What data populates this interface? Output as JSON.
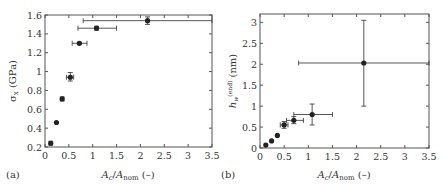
{
  "chart_data": [
    {
      "panel": "(a)",
      "type": "scatter",
      "xlabel": "A_c/A_nom (–)",
      "ylabel": "σ_x (GPa)",
      "xlim": [
        0,
        3.5
      ],
      "ylim": [
        0.2,
        1.6
      ],
      "xticks": [
        0,
        0.5,
        1,
        1.5,
        2,
        2.5,
        3,
        3.5
      ],
      "yticks": [
        0.2,
        0.4,
        0.6,
        0.8,
        1,
        1.2,
        1.4,
        1.6
      ],
      "grid": false,
      "points": [
        {
          "x": 0.12,
          "y": 0.24,
          "xerr": [
            0.1,
            0.14
          ],
          "yerr": [
            0.22,
            0.26
          ]
        },
        {
          "x": 0.24,
          "y": 0.46,
          "xerr": [
            0.24,
            0.24
          ],
          "yerr": [
            0.46,
            0.46
          ]
        },
        {
          "x": 0.36,
          "y": 0.71,
          "xerr": [
            0.34,
            0.38
          ],
          "yerr": [
            0.69,
            0.73
          ]
        },
        {
          "x": 0.53,
          "y": 0.94,
          "xerr": [
            0.45,
            0.6
          ],
          "yerr": [
            0.9,
            0.99
          ]
        },
        {
          "x": 0.72,
          "y": 1.3,
          "xerr": [
            0.57,
            0.88
          ],
          "yerr": [
            1.29,
            1.31
          ]
        },
        {
          "x": 1.08,
          "y": 1.46,
          "xerr": [
            0.69,
            1.5
          ],
          "yerr": [
            1.44,
            1.48
          ]
        },
        {
          "x": 2.15,
          "y": 1.54,
          "xerr": [
            0.8,
            3.5
          ],
          "yerr": [
            1.5,
            1.58
          ]
        }
      ]
    },
    {
      "panel": "(b)",
      "type": "scatter",
      "xlabel": "A_c/A_nom (–)",
      "ylabel": "h_w^(end) (nm)",
      "xlim": [
        0,
        3.5
      ],
      "ylim": [
        0,
        3.2
      ],
      "xticks": [
        0,
        0.5,
        1,
        1.5,
        2,
        2.5,
        3,
        3.5
      ],
      "yticks": [
        0,
        0.5,
        1,
        1.5,
        2,
        2.5,
        3
      ],
      "grid": false,
      "points": [
        {
          "x": 0.12,
          "y": 0.07,
          "xerr": [
            0.12,
            0.12
          ],
          "yerr": [
            0.07,
            0.07
          ]
        },
        {
          "x": 0.24,
          "y": 0.17,
          "xerr": [
            0.24,
            0.24
          ],
          "yerr": [
            0.17,
            0.17
          ]
        },
        {
          "x": 0.36,
          "y": 0.3,
          "xerr": [
            0.36,
            0.36
          ],
          "yerr": [
            0.3,
            0.3
          ]
        },
        {
          "x": 0.5,
          "y": 0.55,
          "xerr": [
            0.42,
            0.58
          ],
          "yerr": [
            0.47,
            0.63
          ]
        },
        {
          "x": 0.7,
          "y": 0.66,
          "xerr": [
            0.55,
            0.9
          ],
          "yerr": [
            0.58,
            0.75
          ]
        },
        {
          "x": 1.08,
          "y": 0.8,
          "xerr": [
            0.7,
            1.5
          ],
          "yerr": [
            0.55,
            1.05
          ]
        },
        {
          "x": 2.15,
          "y": 2.03,
          "xerr": [
            0.8,
            3.5
          ],
          "yerr": [
            1.0,
            3.05
          ]
        }
      ]
    }
  ],
  "labels": {
    "panel_a": "(a)",
    "panel_b": "(b)"
  }
}
